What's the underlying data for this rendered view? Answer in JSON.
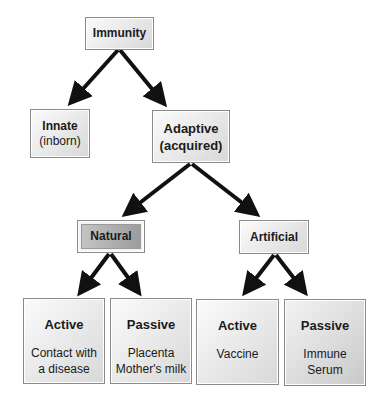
{
  "diagram": {
    "type": "tree",
    "root": {
      "label": "Immunity"
    },
    "level1": [
      {
        "title": "Innate",
        "subtitle": "(inborn)"
      },
      {
        "title": "Adaptive",
        "subtitle": "(acquired)"
      }
    ],
    "level2": [
      {
        "title": "Natural"
      },
      {
        "title": "Artificial"
      }
    ],
    "level3": [
      {
        "title": "Active",
        "lines": [
          "Contact with",
          "a disease"
        ]
      },
      {
        "title": "Passive",
        "lines": [
          "Placenta",
          "Mother's milk"
        ]
      },
      {
        "title": "Active",
        "lines": [
          "Vaccine"
        ]
      },
      {
        "title": "Passive",
        "lines": [
          "Immune",
          "Serum"
        ]
      }
    ],
    "edges": [
      [
        "Immunity",
        "Innate"
      ],
      [
        "Immunity",
        "Adaptive"
      ],
      [
        "Adaptive",
        "Natural"
      ],
      [
        "Adaptive",
        "Artificial"
      ],
      [
        "Natural",
        "Active (Contact with a disease)"
      ],
      [
        "Natural",
        "Passive (Placenta, Mother's milk)"
      ],
      [
        "Artificial",
        "Active (Vaccine)"
      ],
      [
        "Artificial",
        "Passive (Immune Serum)"
      ]
    ],
    "colors": {
      "arrow": "#111111",
      "box_border": "#8a8a8a",
      "natural_fill": "#a8a8a8",
      "passive_serum_fill": "#cfcfcf"
    }
  }
}
